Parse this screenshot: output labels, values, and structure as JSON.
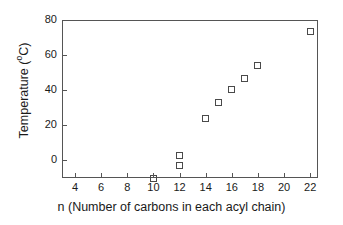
{
  "chart_data": {
    "type": "scatter",
    "title": "",
    "xlabel": "n (Number of carbons in each acyl chain)",
    "ylabel": "Temperature (°C)",
    "ylabel_prefix": "Temperature (",
    "ylabel_degree": "o",
    "ylabel_suffix": "C)",
    "xlim": [
      3,
      22.6
    ],
    "ylim": [
      -10,
      80
    ],
    "grid": false,
    "legend": null,
    "xticks": [
      4,
      6,
      8,
      10,
      12,
      14,
      16,
      18,
      20,
      22
    ],
    "xtick_labels": [
      "4",
      "6",
      "8",
      "10",
      "12",
      "14",
      "16",
      "18",
      "20",
      "22"
    ],
    "yticks": [
      0,
      20,
      40,
      60,
      80
    ],
    "ytick_labels": [
      "0",
      "20",
      "40",
      "60",
      "80"
    ],
    "marker": "open-square",
    "marker_color": "#4a4a4a",
    "frame_color": "#555555",
    "background_color": "#ffffff",
    "x": [
      10,
      12,
      12,
      14,
      15,
      16,
      17,
      18,
      22
    ],
    "y": [
      -10,
      3,
      -3,
      24,
      33,
      40.5,
      46.5,
      54,
      73.5
    ],
    "points": [
      {
        "n": 10,
        "temperature": -10
      },
      {
        "n": 12,
        "temperature": 3
      },
      {
        "n": 12,
        "temperature": -3
      },
      {
        "n": 14,
        "temperature": 24
      },
      {
        "n": 15,
        "temperature": 33
      },
      {
        "n": 16,
        "temperature": 40.5
      },
      {
        "n": 17,
        "temperature": 46.5
      },
      {
        "n": 18,
        "temperature": 54
      },
      {
        "n": 22,
        "temperature": 73.5
      }
    ]
  }
}
